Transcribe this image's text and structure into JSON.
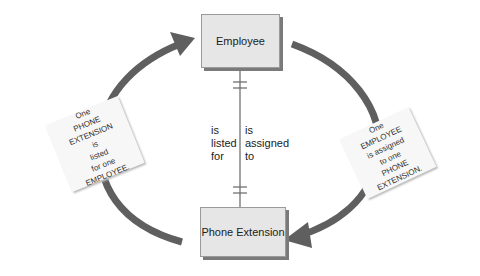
{
  "entities": {
    "top": "Employee",
    "bottom": "Phone Extension"
  },
  "relationship": {
    "left_label": [
      "is",
      "listed",
      "for"
    ],
    "right_label": [
      "is",
      "assigned",
      "to"
    ],
    "cardinality_top": "one (mandatory)",
    "cardinality_bottom": "one (mandatory)"
  },
  "notes": {
    "left": [
      "One",
      "PHONE",
      "EXTENSION",
      "is",
      "listed",
      "for one",
      "EMPLOYEE."
    ],
    "right": [
      "One",
      "EMPLOYEE",
      "is assigned",
      "to one",
      "PHONE",
      "EXTENSION."
    ]
  },
  "colors": {
    "arrow": "#5f5f5f",
    "entity_fill": "#e6e6e6",
    "line": "#666666"
  }
}
